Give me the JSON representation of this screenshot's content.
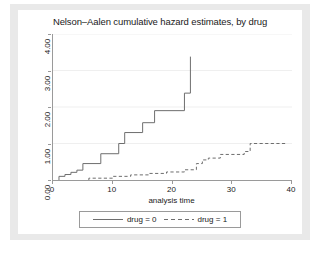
{
  "chart_data": {
    "type": "line",
    "subtype": "step",
    "title": "Nelson–Aalen cumulative hazard estimates, by drug",
    "xlabel": "analysis time",
    "ylabel": "",
    "xlim": [
      0,
      40
    ],
    "ylim": [
      0,
      4.0
    ],
    "xticks": [
      "0",
      "10",
      "20",
      "30",
      "40"
    ],
    "xtick_values": [
      0,
      10,
      20,
      30,
      40
    ],
    "yticks": [
      "0.00",
      "1.00",
      "2.00",
      "3.00",
      "4.00"
    ],
    "ytick_values": [
      0,
      1,
      2,
      3,
      4
    ],
    "grid": "horizontal",
    "legend_position": "bottom",
    "series": [
      {
        "name": "drug = 0",
        "style": "solid",
        "color": "#6e6e6e",
        "points": [
          [
            1.0,
            0.0
          ],
          [
            1.0,
            0.1
          ],
          [
            2.0,
            0.1
          ],
          [
            2.0,
            0.15
          ],
          [
            3.0,
            0.15
          ],
          [
            3.0,
            0.21
          ],
          [
            4.0,
            0.21
          ],
          [
            4.0,
            0.27
          ],
          [
            5.0,
            0.27
          ],
          [
            5.0,
            0.45
          ],
          [
            8.0,
            0.45
          ],
          [
            8.0,
            0.72
          ],
          [
            11.0,
            0.72
          ],
          [
            11.0,
            1.0
          ],
          [
            12.0,
            1.0
          ],
          [
            12.0,
            1.3
          ],
          [
            15.0,
            1.3
          ],
          [
            15.0,
            1.57
          ],
          [
            17.0,
            1.57
          ],
          [
            17.0,
            1.9
          ],
          [
            22.0,
            1.9
          ],
          [
            22.0,
            2.38
          ],
          [
            23.0,
            2.38
          ],
          [
            23.0,
            3.38
          ]
        ]
      },
      {
        "name": "drug = 1",
        "style": "dashed",
        "color": "#6e6e6e",
        "points": [
          [
            6.0,
            0.0
          ],
          [
            6.0,
            0.05
          ],
          [
            10.0,
            0.05
          ],
          [
            10.0,
            0.1
          ],
          [
            13.0,
            0.1
          ],
          [
            13.0,
            0.14
          ],
          [
            16.0,
            0.14
          ],
          [
            16.0,
            0.18
          ],
          [
            19.0,
            0.18
          ],
          [
            19.0,
            0.22
          ],
          [
            22.0,
            0.22
          ],
          [
            22.0,
            0.28
          ],
          [
            24.0,
            0.28
          ],
          [
            24.0,
            0.45
          ],
          [
            25.0,
            0.45
          ],
          [
            25.0,
            0.55
          ],
          [
            26.0,
            0.55
          ],
          [
            26.0,
            0.6
          ],
          [
            28.0,
            0.6
          ],
          [
            28.0,
            0.7
          ],
          [
            32.0,
            0.7
          ],
          [
            32.0,
            0.78
          ],
          [
            33.0,
            0.78
          ],
          [
            33.0,
            1.0
          ],
          [
            39.0,
            1.0
          ]
        ]
      }
    ]
  },
  "legend": {
    "entries": [
      {
        "label": "drug = 0",
        "style": "solid"
      },
      {
        "label": "drug = 1",
        "style": "dashed"
      }
    ]
  },
  "colors": {
    "line": "#6e6e6e",
    "axis": "#9a9a9a",
    "grid": "#efefef",
    "text": "#1a1a1a",
    "graph_background": "#e9e9e9",
    "plot_background": "#ffffff"
  }
}
